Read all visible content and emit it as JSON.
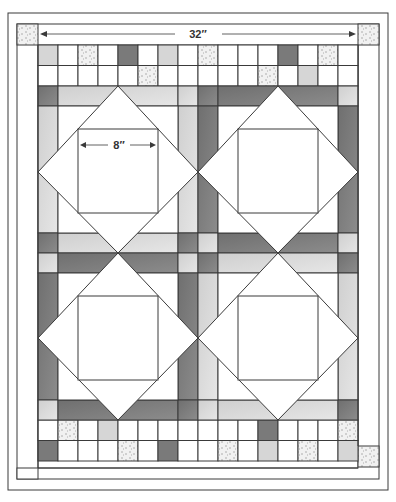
{
  "diagram": {
    "dimensions": {
      "overall_width_label": "32″",
      "block_center_label": "8″"
    },
    "colors": {
      "line": "#3a3a3a",
      "white": "#ffffff",
      "light": "#d9d9d9",
      "medium": "#bdbdbd",
      "dark": "#7a7a7a",
      "speckle": "#efefef",
      "speckle_dot": "#9a9a9a"
    },
    "blocks": [
      {
        "id": "block-top-left",
        "label": "Square-in-square block"
      },
      {
        "id": "block-top-right",
        "label": "Square-in-square block"
      },
      {
        "id": "block-bottom-left",
        "label": "Square-in-square block"
      },
      {
        "id": "block-bottom-right",
        "label": "Square-in-square block"
      }
    ],
    "top_rows": [
      [
        "light",
        "white",
        "speckle",
        "white",
        "dark",
        "white",
        "light",
        "white",
        "speckle",
        "white",
        "white",
        "white",
        "dark",
        "white",
        "speckle",
        "white"
      ],
      [
        "white",
        "white",
        "white",
        "white",
        "white",
        "speckle",
        "white",
        "white",
        "white",
        "white",
        "white",
        "speckle",
        "white",
        "light",
        "white",
        "white"
      ]
    ],
    "bottom_rows": [
      [
        "white",
        "speckle",
        "white",
        "light",
        "white",
        "white",
        "white",
        "white",
        "white",
        "white",
        "white",
        "dark",
        "white",
        "white",
        "white",
        "speckle"
      ],
      [
        "dark",
        "white",
        "white",
        "white",
        "speckle",
        "white",
        "dark",
        "white",
        "white",
        "speckle",
        "white",
        "light",
        "white",
        "speckle",
        "white",
        "light"
      ]
    ],
    "border_corners": [
      "speckle",
      "speckle",
      "speckle",
      "speckle"
    ]
  }
}
